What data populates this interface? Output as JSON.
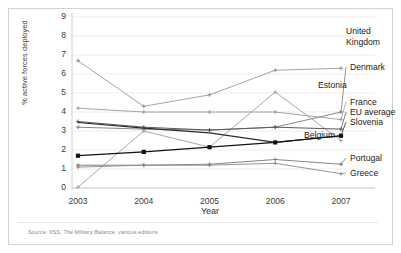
{
  "figure": {
    "axis_title_x": "Year",
    "axis_title_y": "% active forces deployed",
    "source_prefix": "Source: IISS, ",
    "source_italic": "The Military Balance",
    "source_suffix": ", various editions"
  },
  "chart_data": {
    "type": "line",
    "title": "",
    "xlabel": "Year",
    "ylabel": "% active forces deployed",
    "x": [
      "2003",
      "2004",
      "2005",
      "2006",
      "2007"
    ],
    "xlim": [
      "2003",
      "2007"
    ],
    "ylim": [
      0,
      9
    ],
    "yticks": [
      0,
      1,
      2,
      3,
      4,
      5,
      6,
      7,
      8,
      9
    ],
    "grid": "horizontal",
    "legend_position": "right-inline-labels",
    "series": [
      {
        "name": "United Kingdom",
        "values": [
          6.7,
          4.3,
          4.9,
          6.2,
          6.3
        ],
        "color": "#8c8c8c",
        "marker": "tick",
        "width": 0.8
      },
      {
        "name": "Denmark",
        "values": [
          3.2,
          3.1,
          3.05,
          3.2,
          4.0
        ],
        "color": "#7a7a7a",
        "marker": "tick",
        "width": 0.9
      },
      {
        "name": "Estonia",
        "values": [
          0.05,
          3.0,
          2.15,
          5.05,
          2.5
        ],
        "color": "#9e9e9e",
        "marker": "tick",
        "width": 0.9
      },
      {
        "name": "France",
        "values": [
          4.2,
          4.0,
          4.0,
          4.0,
          3.6
        ],
        "color": "#9a9a9a",
        "marker": "tick",
        "width": 0.9
      },
      {
        "name": "EU average",
        "values": [
          3.5,
          3.2,
          3.05,
          3.2,
          3.1
        ],
        "color": "#5a5a5a",
        "marker": "tick",
        "width": 1.0
      },
      {
        "name": "Slovenia",
        "values": [
          3.45,
          3.15,
          2.9,
          2.4,
          2.75
        ],
        "color": "#2b2b2b",
        "marker": "none",
        "width": 1.1
      },
      {
        "name": "Belgium",
        "values": [
          1.7,
          1.9,
          2.15,
          2.4,
          2.75
        ],
        "color": "#111111",
        "marker": "square",
        "width": 1.2
      },
      {
        "name": "Portugal",
        "values": [
          1.2,
          1.2,
          1.25,
          1.5,
          1.25
        ],
        "color": "#767676",
        "marker": "tick",
        "width": 0.9
      },
      {
        "name": "Greece",
        "values": [
          1.1,
          1.2,
          1.2,
          1.3,
          0.75
        ],
        "color": "#8a8a8a",
        "marker": "tick",
        "width": 0.9
      }
    ],
    "series_labels": [
      {
        "name": "United Kingdom",
        "lines": [
          "United",
          "Kingdom"
        ],
        "x": 346,
        "y": 26
      },
      {
        "name": "Denmark",
        "lines": [
          "Denmark"
        ],
        "x": 350,
        "y": 62
      },
      {
        "name": "Estonia",
        "lines": [
          "Estonia"
        ],
        "x": 318,
        "y": 80
      },
      {
        "name": "France",
        "lines": [
          "France"
        ],
        "x": 350,
        "y": 97
      },
      {
        "name": "EU average",
        "lines": [
          "EU average"
        ],
        "x": 350,
        "y": 107
      },
      {
        "name": "Slovenia",
        "lines": [
          "Slovenia"
        ],
        "x": 350,
        "y": 117
      },
      {
        "name": "Belgium",
        "lines": [
          "Belgium"
        ],
        "x": 304,
        "y": 130
      },
      {
        "name": "Portugal",
        "lines": [
          "Portugal"
        ],
        "x": 350,
        "y": 153
      },
      {
        "name": "Greece",
        "lines": [
          "Greece"
        ],
        "x": 350,
        "y": 168
      }
    ]
  }
}
